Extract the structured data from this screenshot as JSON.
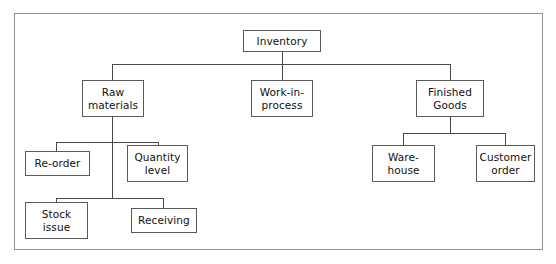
{
  "diagram": {
    "type": "hierarchy-tree",
    "frame": {
      "border_color": "#8f8f8f",
      "background": "#ffffff"
    },
    "node_style": {
      "border_color": "#5a5a5a",
      "text_color": "#111111",
      "background": "#ffffff"
    },
    "connector_color": "#4a4a4a",
    "nodes": [
      {
        "id": "inventory",
        "label": "Inventory",
        "level": 0,
        "x": 243,
        "y": 30,
        "w": 78,
        "h": 22
      },
      {
        "id": "raw",
        "label": "Raw\nmaterials",
        "level": 1,
        "x": 82,
        "y": 80,
        "w": 62,
        "h": 37
      },
      {
        "id": "wip",
        "label": "Work-in-\nprocess",
        "level": 1,
        "x": 251,
        "y": 80,
        "w": 62,
        "h": 37
      },
      {
        "id": "finished",
        "label": "Finished\nGoods",
        "level": 1,
        "x": 416,
        "y": 80,
        "w": 68,
        "h": 37
      },
      {
        "id": "reorder",
        "label": "Re-order",
        "level": 2,
        "x": 25,
        "y": 151,
        "w": 65,
        "h": 25
      },
      {
        "id": "quantity",
        "label": "Quantity\nlevel",
        "level": 2,
        "x": 127,
        "y": 145,
        "w": 61,
        "h": 37
      },
      {
        "id": "stock",
        "label": "Stock\nissue",
        "level": 2,
        "x": 25,
        "y": 202,
        "w": 63,
        "h": 37
      },
      {
        "id": "receiving",
        "label": "Receiving",
        "level": 2,
        "x": 131,
        "y": 208,
        "w": 66,
        "h": 25
      },
      {
        "id": "warehouse",
        "label": "Ware-\nhouse",
        "level": 2,
        "x": 372,
        "y": 145,
        "w": 63,
        "h": 37
      },
      {
        "id": "customer",
        "label": "Customer\norder",
        "level": 2,
        "x": 476,
        "y": 145,
        "w": 59,
        "h": 37
      }
    ],
    "edges": [
      {
        "from": "inventory",
        "to": "raw"
      },
      {
        "from": "inventory",
        "to": "wip"
      },
      {
        "from": "inventory",
        "to": "finished"
      },
      {
        "from": "raw",
        "to": "reorder"
      },
      {
        "from": "raw",
        "to": "quantity"
      },
      {
        "from": "raw",
        "to": "stock"
      },
      {
        "from": "raw",
        "to": "receiving"
      },
      {
        "from": "finished",
        "to": "warehouse"
      },
      {
        "from": "finished",
        "to": "customer"
      }
    ],
    "connector_paths": [
      "M282,52 L282,64",
      "M112,64 L450,64",
      "M112,64 L112,80",
      "M282,64 L282,80",
      "M450,64 L450,80",
      "M112,117 L112,198",
      "M56,142 L158,142",
      "M56,142 L56,151",
      "M158,142 L158,145",
      "M56,198 L163,198",
      "M56,198 L56,202",
      "M163,198 L163,208",
      "M450,117 L450,133",
      "M403,133 L505,133",
      "M403,133 L403,145",
      "M505,133 L505,145"
    ]
  }
}
